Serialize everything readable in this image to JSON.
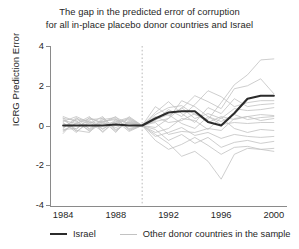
{
  "chart_data": {
    "type": "line",
    "title": "The gap in the predicted error of corruption for all in-place placebo donor countries and Israel",
    "title_line1": "The gap in the predicted error of corruption",
    "title_line2": "for all in-place placebo donor countries and Israel",
    "xlabel": "",
    "ylabel": "ICRG Prediction Error",
    "xlim": [
      1983,
      2001
    ],
    "ylim": [
      -4,
      4
    ],
    "xticks": [
      1984,
      1988,
      1992,
      1996,
      2000
    ],
    "yticks": [
      4,
      2,
      0,
      -2,
      -4
    ],
    "grid": false,
    "legend_position": "below-axis",
    "annotations": [
      {
        "type": "vline",
        "x": 1990,
        "style": "dotted",
        "color": "#b9b9b9",
        "label": ""
      }
    ],
    "x": [
      1984,
      1985,
      1986,
      1987,
      1988,
      1989,
      1990,
      1991,
      1992,
      1993,
      1994,
      1995,
      1996,
      1997,
      1998,
      1999,
      2000
    ],
    "series": [
      {
        "name": "Israel",
        "color": "#2b2b2b",
        "width": 2.1,
        "values": [
          0.0,
          0.0,
          0.0,
          0.0,
          0.05,
          0.0,
          0.0,
          0.35,
          0.65,
          0.72,
          0.72,
          0.18,
          0.0,
          0.62,
          1.35,
          1.5,
          1.5
        ]
      },
      {
        "name": "Other donor countries in the sample",
        "color": "#c2c2c2",
        "width": 0.8,
        "values": [
          -0.25,
          0.1,
          0.35,
          0.15,
          -0.1,
          0.15,
          0.0,
          0.55,
          0.9,
          1.0,
          0.55,
          0.3,
          1.15,
          2.05,
          2.55,
          3.3,
          3.35
        ]
      },
      {
        "name": "Other donor countries in the sample",
        "color": "#c2c2c2",
        "width": 0.8,
        "values": [
          0.45,
          0.2,
          -0.15,
          0.3,
          0.4,
          0.1,
          0.0,
          0.95,
          0.5,
          0.85,
          1.5,
          1.2,
          0.85,
          1.85,
          2.0,
          2.35,
          1.6
        ]
      },
      {
        "name": "Other donor countries in the sample",
        "color": "#c2c2c2",
        "width": 0.8,
        "values": [
          0.15,
          -0.35,
          0.25,
          -0.2,
          0.3,
          -0.15,
          0.0,
          0.25,
          0.8,
          0.45,
          1.05,
          1.75,
          1.45,
          0.95,
          1.15,
          1.25,
          1.25
        ]
      },
      {
        "name": "Other donor countries in the sample",
        "color": "#c2c2c2",
        "width": 0.8,
        "values": [
          -0.1,
          0.3,
          0.1,
          0.45,
          -0.25,
          0.2,
          0.0,
          -0.1,
          0.35,
          0.9,
          0.35,
          0.6,
          0.35,
          0.85,
          0.75,
          0.8,
          0.9
        ]
      },
      {
        "name": "Other donor countries in the sample",
        "color": "#c2c2c2",
        "width": 0.8,
        "values": [
          0.3,
          -0.2,
          0.4,
          0.1,
          0.15,
          0.35,
          0.0,
          0.45,
          0.15,
          0.25,
          0.6,
          0.15,
          0.45,
          0.3,
          0.45,
          0.55,
          0.5
        ]
      },
      {
        "name": "Other donor countries in the sample",
        "color": "#c2c2c2",
        "width": 0.8,
        "values": [
          -0.3,
          0.15,
          -0.25,
          0.2,
          0.35,
          -0.2,
          0.0,
          0.3,
          0.55,
          0.1,
          -0.15,
          0.45,
          0.05,
          0.15,
          0.1,
          0.15,
          0.15
        ]
      },
      {
        "name": "Other donor countries in the sample",
        "color": "#c2c2c2",
        "width": 0.8,
        "values": [
          0.2,
          0.45,
          0.15,
          -0.3,
          0.2,
          0.4,
          0.0,
          -0.35,
          -0.15,
          0.35,
          0.25,
          -0.2,
          0.4,
          -0.15,
          -0.35,
          -0.2,
          -0.25
        ]
      },
      {
        "name": "Other donor countries in the sample",
        "color": "#c2c2c2",
        "width": 0.8,
        "values": [
          -0.2,
          -0.15,
          0.3,
          0.35,
          -0.3,
          0.25,
          0.0,
          -0.55,
          -0.35,
          -0.1,
          -0.5,
          -0.35,
          -0.65,
          -0.45,
          -0.55,
          -0.6,
          -0.55
        ]
      },
      {
        "name": "Other donor countries in the sample",
        "color": "#c2c2c2",
        "width": 0.8,
        "values": [
          0.35,
          0.25,
          -0.3,
          0.15,
          0.45,
          -0.25,
          0.0,
          -0.2,
          -0.75,
          -0.45,
          -0.9,
          -0.6,
          -1.1,
          -0.85,
          -0.75,
          -0.9,
          -0.8
        ]
      },
      {
        "name": "Other donor countries in the sample",
        "color": "#c2c2c2",
        "width": 0.8,
        "values": [
          -0.4,
          0.35,
          0.2,
          -0.15,
          0.1,
          0.3,
          0.0,
          -0.75,
          -1.2,
          -0.95,
          -0.6,
          -1.0,
          -1.45,
          -1.1,
          -1.05,
          -1.2,
          -1.15
        ]
      },
      {
        "name": "Other donor countries in the sample",
        "color": "#c2c2c2",
        "width": 0.8,
        "values": [
          0.1,
          -0.25,
          -0.35,
          0.4,
          -0.2,
          0.15,
          0.0,
          -0.45,
          -0.9,
          -1.55,
          -1.3,
          -1.8,
          -2.7,
          -1.45,
          -1.15,
          -1.2,
          -1.3
        ]
      },
      {
        "name": "Other donor countries in the sample",
        "color": "#c2c2c2",
        "width": 0.8,
        "values": [
          0.25,
          0.1,
          0.45,
          -0.35,
          0.25,
          -0.3,
          0.0,
          0.15,
          -0.45,
          -0.3,
          -0.35,
          -0.15,
          -0.25,
          0.35,
          0.45,
          0.25,
          0.35
        ]
      },
      {
        "name": "Other donor countries in the sample",
        "color": "#c2c2c2",
        "width": 0.8,
        "values": [
          -0.15,
          0.4,
          -0.2,
          0.25,
          -0.35,
          0.45,
          0.0,
          0.65,
          1.2,
          0.6,
          0.15,
          0.9,
          0.6,
          1.35,
          0.95,
          1.05,
          1.1
        ]
      },
      {
        "name": "Other donor countries in the sample",
        "color": "#c2c2c2",
        "width": 0.8,
        "values": [
          0.4,
          -0.3,
          0.15,
          0.2,
          0.3,
          0.1,
          0.0,
          0.2,
          0.35,
          1.25,
          0.95,
          0.45,
          0.2,
          0.55,
          0.3,
          0.4,
          0.45
        ]
      }
    ],
    "legend": [
      {
        "label": "Israel",
        "color": "#2b2b2b",
        "style": "thick-solid"
      },
      {
        "label": "Other donor countries in the sample",
        "color": "#c2c2c2",
        "style": "thin-solid"
      }
    ]
  }
}
